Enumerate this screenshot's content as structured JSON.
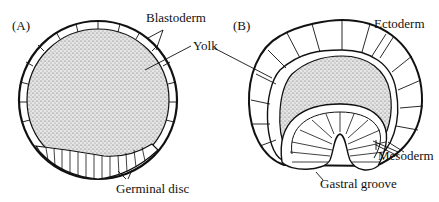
{
  "panels": [
    {
      "id": "A",
      "label": "(A)",
      "annotations": {
        "blastoderm": "Blastoderm",
        "yolk": "Yolk",
        "germinal_disc": "Germinal disc"
      }
    },
    {
      "id": "B",
      "label": "(B)",
      "annotations": {
        "ectoderm": "Ectoderm",
        "mesoderm": "Mesoderm",
        "gastral_groove": "Gastral groove"
      }
    }
  ],
  "colors": {
    "stroke": "#111111",
    "yolk_fill": "#cfcfcf",
    "background": "#ffffff"
  }
}
